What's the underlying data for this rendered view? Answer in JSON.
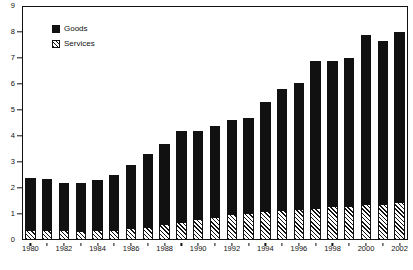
{
  "chart_data": {
    "type": "bar",
    "title": "",
    "subtitle": "",
    "xlabel": "",
    "ylabel": "",
    "stacked": true,
    "grid": false,
    "legend_position": "top-left",
    "ylim": [
      0,
      9
    ],
    "ytick_step": 1,
    "yticks": [
      "0",
      "1",
      "2",
      "3",
      "4",
      "5",
      "6",
      "7",
      "8",
      "9"
    ],
    "categories": [
      "1980",
      "1981",
      "1982",
      "1983",
      "1984",
      "1985",
      "1986",
      "1987",
      "1988",
      "1989",
      "1990",
      "1991",
      "1992",
      "1993",
      "1994",
      "1995",
      "1996",
      "1997",
      "1998",
      "1999",
      "2000",
      "2001",
      "2002"
    ],
    "xtick_labels": [
      "1980",
      "1982",
      "1984",
      "1986",
      "1988",
      "1990",
      "1992",
      "1994",
      "1996",
      "1998",
      "2000",
      "2002"
    ],
    "series": [
      {
        "name": "Services",
        "pattern": "diagonal-hatch",
        "color": "#111111",
        "values": [
          0.4,
          0.4,
          0.4,
          0.35,
          0.4,
          0.4,
          0.45,
          0.5,
          0.6,
          0.7,
          0.8,
          0.9,
          1.0,
          1.05,
          1.1,
          1.15,
          1.2,
          1.25,
          1.3,
          1.3,
          1.4,
          1.4,
          1.45
        ]
      },
      {
        "name": "Goods",
        "pattern": "solid",
        "color": "#111111",
        "values": [
          2.0,
          1.95,
          1.8,
          1.85,
          1.9,
          2.1,
          2.45,
          2.8,
          3.1,
          3.5,
          3.4,
          3.5,
          3.6,
          3.65,
          4.2,
          4.65,
          4.85,
          5.65,
          5.6,
          5.7,
          6.5,
          6.25,
          6.55
        ]
      }
    ],
    "totals": [
      2.4,
      2.35,
      2.2,
      2.2,
      2.3,
      2.5,
      2.9,
      3.3,
      3.7,
      4.2,
      4.2,
      4.4,
      4.6,
      4.7,
      5.3,
      5.8,
      6.05,
      6.9,
      6.9,
      7.0,
      7.9,
      7.65,
      8.0
    ]
  },
  "legend": {
    "items": [
      {
        "label": "Goods",
        "swatch": "solid"
      },
      {
        "label": "Services",
        "swatch": "hatched"
      }
    ]
  }
}
